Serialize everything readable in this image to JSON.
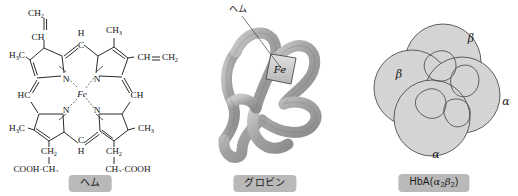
{
  "figure": {
    "background_color": "#ffffff",
    "ink_color": "#1a1a1a",
    "caption_box_color": "#b9b9b9",
    "subunit_fill_color": "#d2d2d2",
    "ribbon_color": "#a9a9a9"
  },
  "panels": [
    {
      "id": "heme",
      "caption": "ヘム",
      "center_atom": "Fe",
      "ring_nitrogens": [
        "N",
        "N",
        "N",
        "N"
      ],
      "meso_carbons": [
        {
          "label": "C",
          "h": "H",
          "position": "top"
        },
        {
          "label": "C",
          "h": "H",
          "position": "bottom"
        },
        {
          "label": "HC",
          "position": "left"
        },
        {
          "label": "CH",
          "position": "right"
        }
      ],
      "substituents": [
        {
          "text": "CH",
          "sub": "2",
          "position": "top-vinyl-terminal"
        },
        {
          "text": "CH",
          "position": "top-vinyl-methine"
        },
        {
          "text": "CH",
          "sub": "3",
          "position": "top-right-methyl"
        },
        {
          "text": "CH",
          "position": "right-vinyl-methine"
        },
        {
          "text": "CH",
          "sub": "2",
          "position": "right-vinyl-terminal"
        },
        {
          "text": "H",
          "sub": "3",
          "text2": "C",
          "position": "upper-left-methyl"
        },
        {
          "text": "H",
          "sub": "3",
          "text2": "C",
          "position": "lower-left-methyl"
        },
        {
          "text": "CH",
          "sub": "3",
          "position": "lower-right-methyl"
        },
        {
          "text": "CH",
          "sub": "2",
          "position": "left-propionate-ch2"
        },
        {
          "text": "COOH·CH",
          "sub": "2",
          "position": "left-propionate-tail"
        },
        {
          "text": "CH",
          "sub": "2",
          "position": "right-propionate-ch2"
        },
        {
          "text": "CH",
          "sub": "2",
          "text2": "·COOH",
          "position": "right-propionate-tail"
        }
      ],
      "double_bond_notation": "CH=CH2"
    },
    {
      "id": "globin",
      "caption": "グロビン",
      "pointer_label": "ヘム",
      "heme_plate_label": "Fe",
      "description": "folded polypeptide ribbon with heme plate"
    },
    {
      "id": "hba",
      "caption_prefix": "HbA(",
      "caption_alpha": "α",
      "caption_alpha_sub": "2",
      "caption_beta": "β",
      "caption_beta_sub": "2",
      "caption_suffix": ")",
      "caption_full": "HbA(α2β2)",
      "subunits": [
        {
          "label": "β",
          "position": "top"
        },
        {
          "label": "β",
          "position": "left"
        },
        {
          "label": "α",
          "position": "right"
        },
        {
          "label": "α",
          "position": "bottom"
        }
      ]
    }
  ]
}
